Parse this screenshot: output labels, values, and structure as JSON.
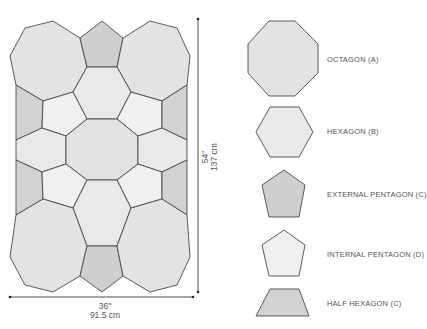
{
  "diagram": {
    "title": "",
    "dimensions": {
      "width_in": "36\"",
      "width_cm": "91.5 cm",
      "height_in": "54\"",
      "height_cm": "137 cm"
    },
    "legend": [
      {
        "shape": "octagon",
        "label": "OCTAGON (A)",
        "fill": "#e3e3e3"
      },
      {
        "shape": "hexagon",
        "label": "HEXAGON (B)",
        "fill": "#e9e9e9"
      },
      {
        "shape": "pentagon",
        "label": "EXTERNAL PENTAGON (C)",
        "fill": "#cfcfcf"
      },
      {
        "shape": "pentagon",
        "label": "INTERNAL PENTAGON (D)",
        "fill": "#f0f0f0"
      },
      {
        "shape": "half-hexagon",
        "label": "HALF HEXAGON (C)",
        "fill": "#d2d2d2"
      }
    ],
    "colors": {
      "outline": "#4a4a4a",
      "background": "#ffffff",
      "text": "#555555"
    }
  }
}
